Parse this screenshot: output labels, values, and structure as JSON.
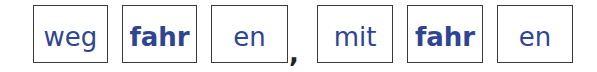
{
  "exercise": {
    "group1": [
      {
        "text": "weg",
        "bold": false
      },
      {
        "text": "fahr",
        "bold": true
      },
      {
        "text": "en",
        "bold": false
      }
    ],
    "separator": ",",
    "group2": [
      {
        "text": "mit",
        "bold": false
      },
      {
        "text": "fahr",
        "bold": true
      },
      {
        "text": "en",
        "bold": false
      }
    ]
  },
  "colors": {
    "text": "#2f4591",
    "border": "#3a3a3a"
  }
}
